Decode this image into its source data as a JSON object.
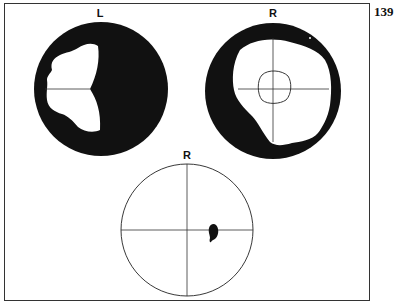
{
  "page_number": "139",
  "fields": [
    {
      "id": "top-left",
      "label": "L",
      "description": "Left eye visual field: dense scotoma with residual temporal-central island"
    },
    {
      "id": "top-right",
      "label": "R",
      "description": "Right eye visual field: peripheral constriction with central circle"
    },
    {
      "id": "bottom",
      "label": "R",
      "description": "Right eye central field with small scotoma right of fixation"
    }
  ],
  "colors": {
    "ink": "#111111",
    "paper": "#ffffff",
    "frame": "#333333"
  }
}
